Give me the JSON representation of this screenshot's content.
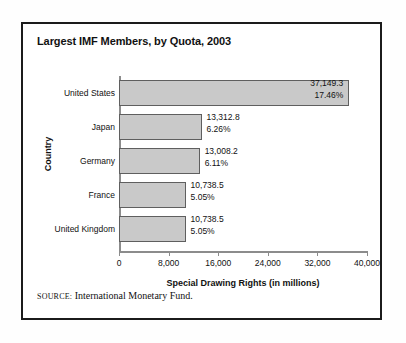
{
  "figure": {
    "title": "Largest IMF Members, by Quota, 2003",
    "source_label": "SOURCE:",
    "source_text": "International Monetary Fund.",
    "frame_color": "#1b1b1b",
    "bar_fill_color": "#c9c9c9",
    "bar_border_color": "#5f5f5f",
    "axis_color": "#8c8c8c",
    "text_color": "#111111"
  },
  "chart_data": {
    "type": "bar",
    "orientation": "horizontal",
    "title": "Largest IMF Members, by Quota, 2003",
    "xlabel": "Special Drawing Rights (in millions)",
    "ylabel": "Country",
    "xlim": [
      0,
      40000
    ],
    "grid": false,
    "legend": null,
    "xticks": [
      0,
      8000,
      16000,
      24000,
      32000,
      40000
    ],
    "xtick_labels": [
      "0",
      "8,000",
      "16,000",
      "24,000",
      "32,000",
      "40,000"
    ],
    "categories": [
      "United States",
      "Japan",
      "Germany",
      "France",
      "United Kingdom"
    ],
    "values": [
      37149.3,
      13312.8,
      13008.2,
      10738.5,
      10738.5
    ],
    "percentages": [
      17.46,
      6.26,
      6.11,
      5.05,
      5.05
    ],
    "bars": [
      {
        "category": "United States",
        "value": 37149.3,
        "value_label": "37,149.3",
        "percent_label": "17.46%",
        "label_position": "inside"
      },
      {
        "category": "Japan",
        "value": 13312.8,
        "value_label": "13,312.8",
        "percent_label": "6.26%",
        "label_position": "outside"
      },
      {
        "category": "Germany",
        "value": 13008.2,
        "value_label": "13,008.2",
        "percent_label": "6.11%",
        "label_position": "outside"
      },
      {
        "category": "France",
        "value": 10738.5,
        "value_label": "10,738.5",
        "percent_label": "5.05%",
        "label_position": "outside"
      },
      {
        "category": "United Kingdom",
        "value": 10738.5,
        "value_label": "10,738.5",
        "percent_label": "5.05%",
        "label_position": "outside"
      }
    ]
  }
}
